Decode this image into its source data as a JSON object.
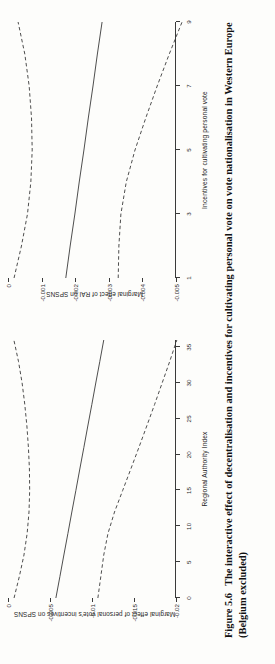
{
  "figure": {
    "number_label": "Figure 5.6",
    "caption_line1": "The interactive effect of decentralisation and incentives for cultivating personal vote on vote nationalisation in Western",
    "caption_line2": "Europe (Belgium excluded)",
    "caption_full": "Figure 5.6  The interactive effect of decentralisation and incentives for cultivating personal vote on vote nationalisation in Western Europe (Belgium excluded)",
    "orientation": "page rotated 90 degrees counter-clockwise",
    "panel_count": 2
  },
  "chart_data": [
    {
      "id": "marginal-effect-rai-panel",
      "type": "line",
      "title": "",
      "xlabel": "Regional Authority Index",
      "ylabel": "Marginal effect of personal vote's incentives on SPSNS",
      "xlim": [
        0,
        36
      ],
      "ylim": [
        -0.02,
        0.0
      ],
      "xticks": [
        0,
        5,
        10,
        15,
        20,
        25,
        30,
        35
      ],
      "xtick_labels": [
        "0",
        "5",
        "10",
        "15",
        "20",
        "25",
        "30",
        "35"
      ],
      "yticks": [
        0,
        -0.005,
        -0.01,
        -0.015,
        -0.02
      ],
      "ytick_labels": [
        "0",
        "-0.005",
        "-0.01",
        "-0.015",
        "-0.02"
      ],
      "grid": false,
      "legend": "none",
      "x": [
        0,
        3,
        6,
        9,
        12,
        15,
        18,
        21,
        24,
        27,
        30,
        33,
        36
      ],
      "series": [
        {
          "name": "Marginal effect (point estimate)",
          "style": "solid",
          "values": [
            -0.0057,
            -0.00618,
            -0.00665,
            -0.00713,
            -0.0076,
            -0.00808,
            -0.00855,
            -0.00903,
            -0.0095,
            -0.00998,
            -0.01045,
            -0.01093,
            -0.0114
          ]
        },
        {
          "name": "Upper 95% confidence bound",
          "style": "dashed",
          "values": [
            -0.00072,
            -0.00135,
            -0.0019,
            -0.00228,
            -0.0025,
            -0.00258,
            -0.00255,
            -0.00243,
            -0.00225,
            -0.002,
            -0.00168,
            -0.00125,
            -0.0007
          ]
        },
        {
          "name": "Lower 95% confidence bound",
          "style": "dashed",
          "values": [
            -0.0107,
            -0.01105,
            -0.0114,
            -0.0119,
            -0.01268,
            -0.01365,
            -0.01462,
            -0.01558,
            -0.01652,
            -0.01745,
            -0.01835,
            -0.01925,
            -0.0201
          ]
        }
      ]
    },
    {
      "id": "marginal-effect-incentives-panel",
      "type": "line",
      "title": "",
      "xlabel": "Incentives for cultivating personal vote",
      "ylabel": "Marginal effect of RAI on SPSNS",
      "xlim": [
        1,
        9
      ],
      "ylim": [
        -0.005,
        0.0
      ],
      "xticks": [
        1,
        3,
        5,
        7,
        9
      ],
      "xtick_labels": [
        "1",
        "3",
        "5",
        "7",
        "9"
      ],
      "yticks": [
        0,
        -0.001,
        -0.002,
        -0.003,
        -0.004,
        -0.005
      ],
      "ytick_labels": [
        "0",
        "-0.001",
        "-0.002",
        "-0.003",
        "-0.004",
        "-0.005"
      ],
      "grid": false,
      "legend": "none",
      "x": [
        1,
        2,
        3,
        4,
        5,
        6,
        7,
        8,
        9
      ],
      "series": [
        {
          "name": "Marginal effect (point estimate)",
          "style": "solid",
          "values": [
            -0.00172,
            -0.00185,
            -0.00199,
            -0.00212,
            -0.00226,
            -0.00239,
            -0.00253,
            -0.00266,
            -0.0028
          ]
        },
        {
          "name": "Upper 95% confidence bound",
          "style": "dashed",
          "values": [
            -0.00018,
            -0.0004,
            -0.00058,
            -0.00068,
            -0.00072,
            -0.0007,
            -0.00063,
            -0.0005,
            -0.0003
          ]
        },
        {
          "name": "Lower 95% confidence bound",
          "style": "dashed",
          "values": [
            -0.00328,
            -0.0033,
            -0.00336,
            -0.00352,
            -0.00378,
            -0.0041,
            -0.00444,
            -0.0048,
            -0.00518
          ]
        }
      ]
    }
  ],
  "colors": {
    "ink": "#2b2b2b",
    "line": "#3a3a3a",
    "paper": "#fdfdfb"
  }
}
